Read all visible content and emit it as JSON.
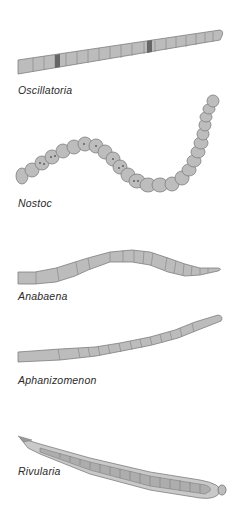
{
  "figure": {
    "type": "scientific-illustration",
    "colors": {
      "cell_fill": "#b9b9b9",
      "cell_stroke": "#7a7a7a",
      "heterocyst_fill": "#6e6e6e",
      "sheath_fill": "#c8c8c8",
      "label_text": "#2a2a2a",
      "background": "#ffffff"
    },
    "specimens": [
      {
        "id": "oscillatoria",
        "label": "Oscillatoria"
      },
      {
        "id": "nostoc",
        "label": "Nostoc"
      },
      {
        "id": "anabaena",
        "label": "Anabaena"
      },
      {
        "id": "aphanizomenon",
        "label": "Aphanizomenon"
      },
      {
        "id": "rivularia",
        "label": "Rivularia"
      }
    ]
  }
}
